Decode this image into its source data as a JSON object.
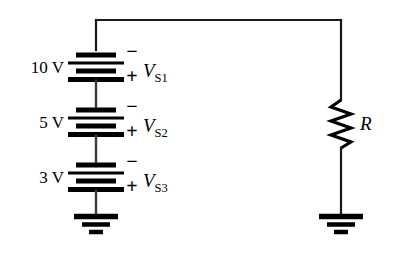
{
  "figure": {
    "background_color": "#ffffff",
    "line_color": "#1a1a1a"
  },
  "sources": [
    {
      "value_label": "10 V",
      "symbol_letter": "V",
      "symbol_subscript": "S1",
      "minus_sign": "−",
      "plus_sign": "+"
    },
    {
      "value_label": "5 V",
      "symbol_letter": "V",
      "symbol_subscript": "S2",
      "minus_sign": "−",
      "plus_sign": "+"
    },
    {
      "value_label": "3 V",
      "symbol_letter": "V",
      "symbol_subscript": "S3",
      "minus_sign": "−",
      "plus_sign": "+"
    }
  ],
  "resistor": {
    "label": "R"
  },
  "grounds": [
    {
      "name": "left-ground"
    },
    {
      "name": "right-ground"
    }
  ]
}
